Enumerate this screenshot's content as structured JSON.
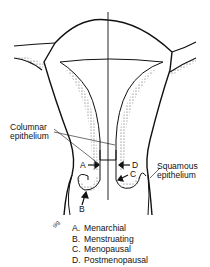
{
  "diagram": {
    "labels": {
      "columnar": [
        "Columnar",
        "epithelium"
      ],
      "squamous": [
        "Squamous",
        "epithelium"
      ],
      "markers": {
        "A": "A",
        "B": "B",
        "C": "C",
        "D": "D"
      }
    },
    "legend": [
      {
        "key": "A.",
        "text": "Menarchial"
      },
      {
        "key": "B.",
        "text": "Menstruating"
      },
      {
        "key": "C.",
        "text": "Menopausal"
      },
      {
        "key": "D.",
        "text": "Postmenopausal"
      }
    ],
    "signature": "sig"
  }
}
